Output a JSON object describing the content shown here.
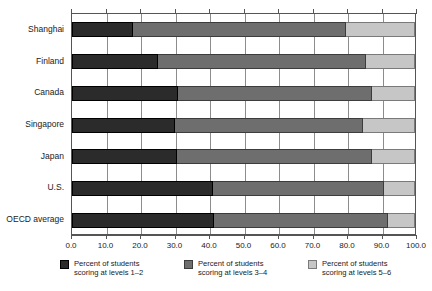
{
  "chart_data": {
    "type": "bar",
    "orientation": "horizontal",
    "stacked": true,
    "title": "",
    "subtitle": "",
    "xlabel": "",
    "ylabel": "",
    "xlim": [
      0,
      100
    ],
    "xticks": [
      0,
      10,
      20,
      30,
      40,
      50,
      60,
      70,
      80,
      90,
      100
    ],
    "xticklabels": [
      "0.0",
      "10.0",
      "20.0",
      "30.0",
      "40.0",
      "50.0",
      "60.0",
      "70.0",
      "80.0",
      "90.0",
      "100.0"
    ],
    "grid": true,
    "grid_axis": "x",
    "legend_position": "bottom",
    "categories": [
      "Shanghai",
      "Finland",
      "Canada",
      "Singapore",
      "Japan",
      "U.S.",
      "OECD average"
    ],
    "series": [
      {
        "name": "Percent of students scoring at levels 1–2",
        "color": "#2b2b2b",
        "values": [
          17.7,
          25.2,
          31.0,
          30.1,
          30.7,
          41.2,
          41.4
        ]
      },
      {
        "name": "Percent of students scoring at levels 3–4",
        "color": "#6e6e6e",
        "values": [
          62.3,
          60.6,
          56.5,
          54.8,
          56.8,
          49.8,
          50.8
        ]
      },
      {
        "name": "Percent of students scoring at levels 5–6",
        "color": "#c6c6c6",
        "values": [
          20.0,
          14.2,
          12.5,
          15.1,
          12.5,
          9.0,
          7.8
        ]
      }
    ]
  },
  "axis": {
    "ticklabels": [
      "0.0",
      "10.0",
      "20.0",
      "30.0",
      "40.0",
      "50.0",
      "60.0",
      "70.0",
      "80.0",
      "90.0",
      "100.0"
    ]
  },
  "categories": {
    "0": "Shanghai",
    "1": "Finland",
    "2": "Canada",
    "3": "Singapore",
    "4": "Japan",
    "5": "U.S.",
    "6": "OECD average"
  },
  "legend": {
    "items": [
      {
        "line1": "Percent of students",
        "line2": "scoring at levels 1–2",
        "swatch": "legend-swatch-dark"
      },
      {
        "line1": "Percent of students",
        "line2": "scoring at levels 3–4",
        "swatch": "legend-swatch-mid"
      },
      {
        "line1": "Percent of students",
        "line2": "scoring at levels 5–6",
        "swatch": "legend-swatch-light"
      }
    ]
  },
  "colors": {
    "level_1_2": "#2b2b2b",
    "level_3_4": "#6e6e6e",
    "level_5_6": "#c6c6c6",
    "axis": "#555555",
    "grid": "#8c8c8c"
  }
}
